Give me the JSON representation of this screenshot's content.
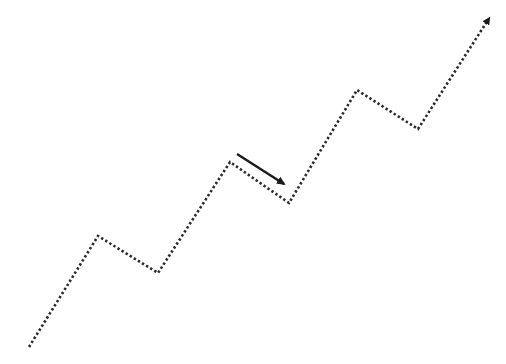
{
  "diagram": {
    "type": "zigzag-trend",
    "background": "#ffffff",
    "trend_line": {
      "style": "dotted",
      "color": "#2b2b2b",
      "points": [
        [
          29,
          347
        ],
        [
          98,
          236
        ],
        [
          158,
          273
        ],
        [
          230,
          162
        ],
        [
          289,
          203
        ],
        [
          357,
          90
        ],
        [
          418,
          129
        ],
        [
          488,
          20
        ]
      ],
      "end_marker": "arrowhead"
    },
    "pullback_arrow": {
      "style": "solid",
      "color": "#1a1a1a",
      "from": [
        237,
        154
      ],
      "to": [
        290,
        188
      ]
    }
  }
}
